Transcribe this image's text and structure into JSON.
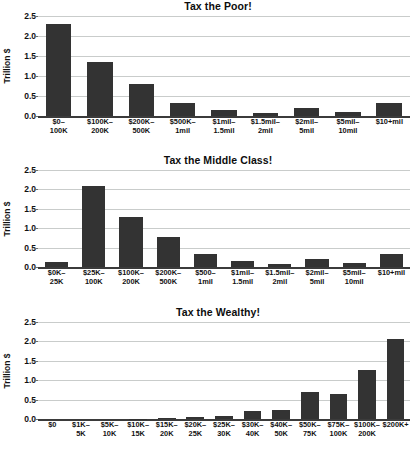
{
  "figure": {
    "axis_label": "Trillion $",
    "y_ticks": [
      "2.5",
      "2.0",
      "1.5",
      "1.0",
      "0.5",
      "0.0"
    ],
    "y_min": 0,
    "y_max": 2.5,
    "bar_color": "#333333",
    "grid_color": "#c9cccb",
    "background": "#ffffff"
  },
  "chart_data": [
    {
      "type": "bar",
      "title": "Tax the Poor!",
      "xlabel": "",
      "ylabel": "Trillion $",
      "ylim": [
        0,
        2.5
      ],
      "yticks": [
        0.0,
        0.5,
        1.0,
        1.5,
        2.0,
        2.5
      ],
      "grid": true,
      "legend": "none",
      "categories": [
        "$0–\n100K",
        "$100K–\n200K",
        "$200K–\n500K",
        "$500K–\n1mil",
        "$1mil–\n1.5mil",
        "$1.5mil–\n2mil",
        "$2mil–\n5mil",
        "$5mil–\n10mil",
        "$10+mil"
      ],
      "category_lines": [
        [
          "$0–",
          "100K"
        ],
        [
          "$100K–",
          "200K"
        ],
        [
          "$200K–",
          "500K"
        ],
        [
          "$500K–",
          "1mil"
        ],
        [
          "$1mil–",
          "1.5mil"
        ],
        [
          "$1.5mil–",
          "2mil"
        ],
        [
          "$2mil–",
          "5mil"
        ],
        [
          "$5mil–",
          "10mil"
        ],
        [
          "$10+mil",
          ""
        ]
      ],
      "values": [
        2.29,
        1.35,
        0.79,
        0.32,
        0.14,
        0.07,
        0.2,
        0.11,
        0.33
      ]
    },
    {
      "type": "bar",
      "title": "Tax the Middle Class!",
      "xlabel": "",
      "ylabel": "Trillion $",
      "ylim": [
        0,
        2.5
      ],
      "yticks": [
        0.0,
        0.5,
        1.0,
        1.5,
        2.0,
        2.5
      ],
      "grid": true,
      "legend": "none",
      "categories": [
        "$0K–\n25K",
        "$25K–\n100K",
        "$100K–\n200K",
        "$200K–\n500K",
        "$500–\n1mil",
        "$1mil–\n1.5mil",
        "$1.5mil–\n2mil",
        "$2mil–\n5mil",
        "$5mil–\n10mil",
        "$10+mil"
      ],
      "category_lines": [
        [
          "$0K–",
          "25K"
        ],
        [
          "$25K–",
          "100K"
        ],
        [
          "$100K–",
          "200K"
        ],
        [
          "$200K–",
          "500K"
        ],
        [
          "$500–",
          "1mil"
        ],
        [
          "$1mil–",
          "1.5mil"
        ],
        [
          "$1.5mil–",
          "2mil"
        ],
        [
          "$2mil–",
          "5mil"
        ],
        [
          "$5mil–",
          "10mil"
        ],
        [
          "$10+mil",
          ""
        ]
      ],
      "values": [
        0.14,
        2.09,
        1.3,
        0.78,
        0.33,
        0.15,
        0.07,
        0.21,
        0.11,
        0.34
      ]
    },
    {
      "type": "bar",
      "title": "Tax the Wealthy!",
      "xlabel": "",
      "ylabel": "Trillion $",
      "ylim": [
        0,
        2.5
      ],
      "yticks": [
        0.0,
        0.5,
        1.0,
        1.5,
        2.0,
        2.5
      ],
      "grid": true,
      "legend": "none",
      "categories": [
        "$0",
        "$1K–\n5K",
        "$5K–\n10K",
        "$10K–\n15K",
        "$15K–\n20K",
        "$20K–\n25K",
        "$25K–\n30K",
        "$30K–\n40K",
        "$40K–\n50K",
        "$50K–\n75K",
        "$75K–\n100K",
        "$100K–\n200K",
        "$200K+"
      ],
      "category_lines": [
        [
          "$0",
          ""
        ],
        [
          "$1K–",
          "5K"
        ],
        [
          "$5K–",
          "10K"
        ],
        [
          "$10K–",
          "15K"
        ],
        [
          "$15K–",
          "20K"
        ],
        [
          "$20K–",
          "25K"
        ],
        [
          "$25K–",
          "30K"
        ],
        [
          "$30K–",
          "40K"
        ],
        [
          "$40K–",
          "50K"
        ],
        [
          "$50K–",
          "75K"
        ],
        [
          "$75K–",
          "100K"
        ],
        [
          "$100K–",
          "200K"
        ],
        [
          "$200K+",
          ""
        ]
      ],
      "values": [
        0.0,
        0.0,
        0.0,
        0.01,
        0.03,
        0.05,
        0.07,
        0.2,
        0.23,
        0.69,
        0.65,
        1.27,
        2.07
      ]
    }
  ]
}
